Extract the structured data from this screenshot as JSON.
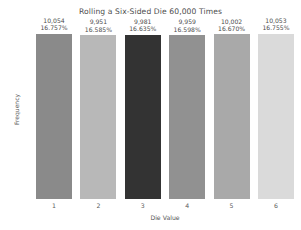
{
  "chart_data": {
    "type": "bar",
    "title": "Rolling a Six-Sided Die 60,000 Times",
    "xlabel": "Die Value",
    "ylabel": "Frequency",
    "categories": [
      "1",
      "2",
      "3",
      "4",
      "5",
      "6"
    ],
    "values": [
      10054,
      9951,
      9981,
      9959,
      10002,
      10053
    ],
    "ylim": [
      0,
      11000
    ],
    "yticks": [
      "0",
      "2000",
      "4000",
      "6000",
      "8000",
      "10000"
    ],
    "ytick_values": [
      0,
      2000,
      4000,
      6000,
      8000,
      10000
    ],
    "grid": false,
    "legend": null,
    "bar_labels": [
      {
        "count": "10,054",
        "pct": "16.757%"
      },
      {
        "count": "9,951",
        "pct": "16.585%"
      },
      {
        "count": "9,981",
        "pct": "16.635%"
      },
      {
        "count": "9,959",
        "pct": "16.598%"
      },
      {
        "count": "10,002",
        "pct": "16.670%"
      },
      {
        "count": "10,053",
        "pct": "16.755%"
      }
    ],
    "bar_colors": [
      "#8a8a8a",
      "#b8b8b8",
      "#333333",
      "#919191",
      "#a9a9a9",
      "#dadada"
    ],
    "background_color": "#ffffff",
    "text_color": "#4d4d4d"
  }
}
